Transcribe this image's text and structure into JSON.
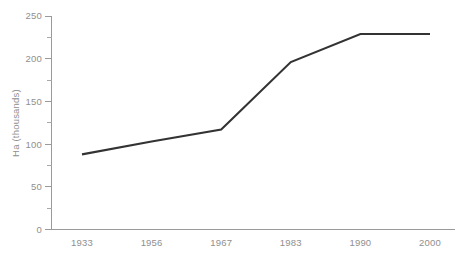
{
  "chart_data": {
    "type": "line",
    "title": "",
    "subtitle": "",
    "xlabel": "",
    "ylabel": "Ha (thousands)",
    "categories": [
      "1933",
      "1956",
      "1967",
      "1983",
      "1990",
      "2000"
    ],
    "values": [
      88,
      103,
      117,
      196,
      229,
      229
    ],
    "series": [
      {
        "name": "Area",
        "values": [
          88,
          103,
          117,
          196,
          229,
          229
        ]
      }
    ],
    "ylim": [
      0,
      250
    ],
    "y_ticks": [
      0,
      50,
      100,
      150,
      200,
      250
    ],
    "y_tick_labels": [
      "0",
      "50",
      "100",
      "150",
      "200",
      "250"
    ],
    "y_minor_ticks": [
      25,
      75,
      125,
      175,
      225
    ],
    "x_tick_labels": [
      "1933",
      "1956",
      "1967",
      "1983",
      "1990",
      "2000"
    ],
    "grid": false,
    "legend": "none",
    "annotations": [],
    "colors": {
      "line": "#333333",
      "axis": "#9a9a9a",
      "text": "#8f8f8f",
      "background": "#ffffff"
    }
  },
  "axes": {
    "y_axis_title": "Ha (thousands)",
    "x_axis_title": ""
  }
}
